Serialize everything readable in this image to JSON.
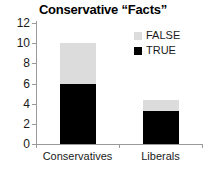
{
  "chart_data": {
    "type": "bar",
    "subtype": "stacked",
    "title": "Conservative “Facts”",
    "subtitle": "",
    "xlabel": "",
    "ylabel": "",
    "categories": [
      "Conservatives",
      "Liberals"
    ],
    "series": [
      {
        "name": "TRUE",
        "color": "#000000",
        "values": [
          6.0,
          3.3
        ]
      },
      {
        "name": "FALSE",
        "color": "#dcdcdc",
        "values": [
          4.0,
          1.1
        ]
      }
    ],
    "stack_totals": [
      10.0,
      4.4
    ],
    "ylim": [
      0,
      12
    ],
    "ytick_values": [
      0,
      2,
      4,
      6,
      8,
      10,
      12
    ],
    "ytick_labels": [
      "0",
      "2",
      "4",
      "6",
      "8",
      "10",
      "12"
    ],
    "grid": false,
    "legend": {
      "position": "top-right",
      "entries": [
        {
          "label": "FALSE",
          "color": "#dcdcdc"
        },
        {
          "label": "TRUE",
          "color": "#000000"
        }
      ]
    },
    "axis_color": "#9a9a9a"
  }
}
